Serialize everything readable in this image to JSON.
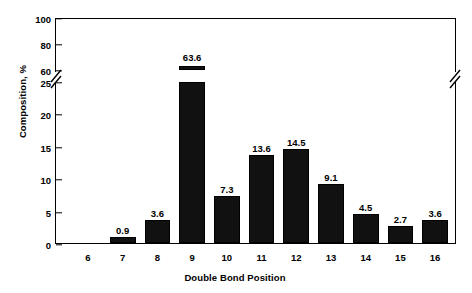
{
  "chart_data": {
    "type": "bar",
    "title": "",
    "xlabel": "Double Bond Position",
    "ylabel": "Composition, %",
    "categories": [
      "6",
      "7",
      "8",
      "9",
      "10",
      "11",
      "12",
      "13",
      "14",
      "15",
      "16"
    ],
    "values": [
      0,
      0.9,
      3.6,
      63.6,
      7.3,
      13.6,
      14.5,
      9.1,
      4.5,
      2.7,
      3.6
    ],
    "value_labels": [
      "",
      "0.9",
      "3.6",
      "63.6",
      "7.3",
      "13.6",
      "14.5",
      "9.1",
      "4.5",
      "2.7",
      "3.6"
    ],
    "ylim": [
      0,
      100
    ],
    "yticks": [
      0,
      5,
      10,
      15,
      20,
      25,
      60,
      80,
      100
    ],
    "ytick_labels": [
      "0",
      "5",
      "10",
      "15",
      "20",
      "25",
      "60",
      "80",
      "100"
    ],
    "axis_break": {
      "low": 25,
      "high": 60,
      "present": true,
      "axes": [
        "left",
        "right"
      ]
    },
    "grid": false,
    "legend": null,
    "bar_color": "#111111",
    "frame": true
  }
}
